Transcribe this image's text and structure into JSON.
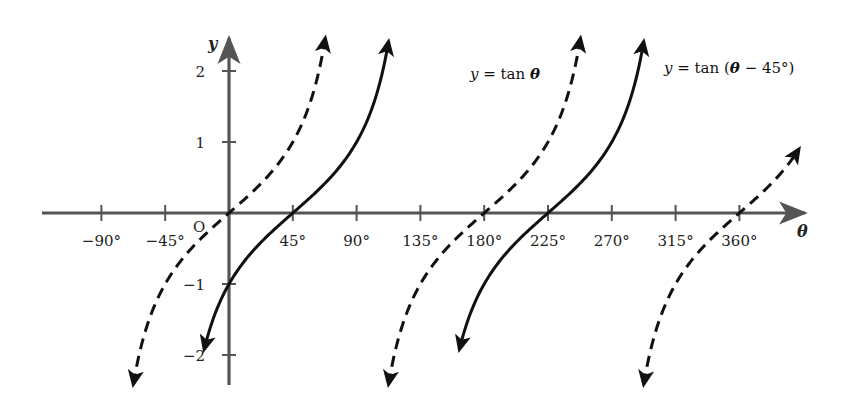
{
  "chart_data": {
    "type": "line",
    "title": "",
    "xlabel": "θ",
    "ylabel": "y",
    "origin_label": "O",
    "xlim": [
      -100,
      380
    ],
    "ylim": [
      -2.4,
      2.5
    ],
    "grid": false,
    "x_ticks": [
      -90,
      -45,
      0,
      45,
      90,
      135,
      180,
      225,
      270,
      315,
      360
    ],
    "x_tick_labels": [
      "−90°",
      "−45°",
      "",
      "45°",
      "90°",
      "135°",
      "180°",
      "225°",
      "270°",
      "315°",
      "360°"
    ],
    "y_ticks": [
      -2,
      -1,
      1,
      2
    ],
    "y_tick_labels": [
      "−2",
      "−1",
      "1",
      "2"
    ],
    "series": [
      {
        "name": "y = tan θ",
        "style": "dashed",
        "function": "tan(theta)",
        "branches": [
          {
            "theta_start": -67.5,
            "theta_end": 67.9
          },
          {
            "theta_start": 112.5,
            "theta_end": 247.9
          },
          {
            "theta_start": 292.5,
            "theta_end": 402
          }
        ],
        "key_points": [
          [
            -45,
            -1
          ],
          [
            0,
            0
          ],
          [
            45,
            1
          ],
          [
            180,
            0
          ],
          [
            360,
            0
          ]
        ]
      },
      {
        "name": "y = tan (θ − 45°)",
        "style": "solid",
        "function": "tan(theta - 45)",
        "branches": [
          {
            "theta_start": -17.5,
            "theta_end": 112.5
          },
          {
            "theta_start": 162.5,
            "theta_end": 292.5
          }
        ],
        "key_points": [
          [
            0,
            -1
          ],
          [
            45,
            0
          ],
          [
            90,
            1
          ],
          [
            225,
            0
          ]
        ]
      }
    ],
    "annotations": [
      {
        "text_parts": [
          {
            "t": "y",
            "s": "it"
          },
          {
            "t": " = tan ",
            "s": ""
          },
          {
            "t": "θ",
            "s": "bi"
          }
        ],
        "x": 470,
        "y": 79
      },
      {
        "text_parts": [
          {
            "t": "y",
            "s": "it"
          },
          {
            "t": " = tan (",
            "s": ""
          },
          {
            "t": "θ",
            "s": "bi"
          },
          {
            "t": " − 45°)",
            "s": ""
          }
        ],
        "x": 664,
        "y": 73
      }
    ],
    "colors": {
      "axis": "#555555",
      "curve": "#111111",
      "text": "#222222"
    }
  }
}
